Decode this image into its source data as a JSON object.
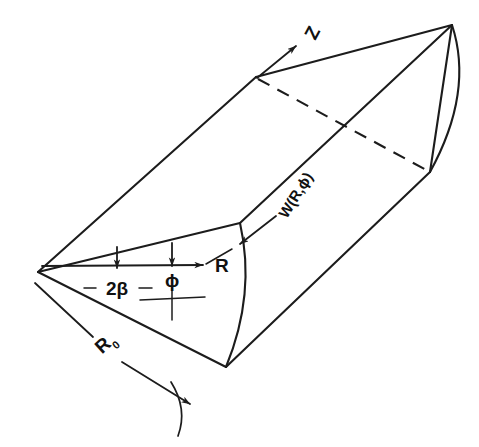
{
  "figure": {
    "kind": "technical-line-diagram",
    "background_color": "#ffffff",
    "ink_color": "#1c1c1c"
  },
  "labels": {
    "axial_axis": "Z",
    "velocity_profile": "W(R,ϕ)",
    "radial_coordinate": "R",
    "angular_coordinate": "ϕ",
    "wedge_angle": "2β",
    "outer_radius_symbol": "R",
    "outer_radius_subscript": "0"
  },
  "geometry": {
    "apex": [
      38,
      272
    ],
    "near_top_vertex": [
      256,
      77
    ],
    "far_top_vertex": [
      452,
      25
    ],
    "near_arc_top": [
      240,
      223
    ],
    "near_arc_bottom": [
      226,
      367
    ],
    "far_arc_bottom": [
      430,
      172
    ],
    "near_face_arc_mid": [
      249,
      292
    ],
    "far_face_arc_mid": [
      466,
      95
    ]
  },
  "annotations": {
    "arrows": [
      {
        "name": "z-axis-arrow",
        "label": "Z",
        "direction": "up-left along axial edge"
      },
      {
        "name": "velocity-arrow",
        "label": "W(R,ϕ)",
        "direction": "down-left onto near face"
      },
      {
        "name": "radius-arrow",
        "label": "R",
        "direction": "right from apex to arc"
      },
      {
        "name": "phi-arrow",
        "label": "ϕ",
        "direction": "down to centerline"
      },
      {
        "name": "beta-arrow",
        "label": "2β",
        "direction": "vertical span across wedge"
      },
      {
        "name": "outer-radius-arrow",
        "label": "R0",
        "direction": "down-right onto outer arc"
      }
    ]
  }
}
